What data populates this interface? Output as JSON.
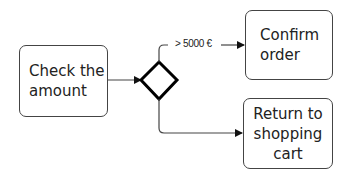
{
  "diagram": {
    "type": "flowchart",
    "nodes": {
      "check": {
        "label": "Check the\namount"
      },
      "gateway": {
        "label": ""
      },
      "confirm": {
        "label": "Confirm\norder"
      },
      "return": {
        "label": "Return to\nshopping\ncart"
      }
    },
    "edges": [
      {
        "from": "check",
        "to": "gateway",
        "label": ""
      },
      {
        "from": "gateway",
        "to": "confirm",
        "label": "> 5000 €"
      },
      {
        "from": "gateway",
        "to": "return",
        "label": ""
      }
    ],
    "condition_label": "> 5000 €"
  }
}
